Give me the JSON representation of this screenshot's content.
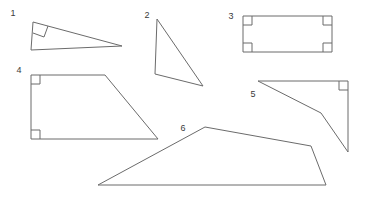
{
  "figure": {
    "background_color": "#ffffff",
    "stroke_color": "#6b6b6b",
    "label_color": "#3a3a3a",
    "width": 366,
    "height": 204,
    "shapes": [
      {
        "id": "shape-1",
        "label": "1",
        "kind": "right-triangle",
        "label_x": 13,
        "label_y": 14,
        "points": "33,22 122,46 31,50 33,22",
        "right_angle_marks": [
          "33,33 44,37 48,26"
        ]
      },
      {
        "id": "shape-2",
        "label": "2",
        "kind": "triangle",
        "label_x": 147,
        "label_y": 16,
        "points": "157,19 155,74 203,86 157,19",
        "right_angle_marks": []
      },
      {
        "id": "shape-3",
        "label": "3",
        "kind": "rectangle",
        "label_x": 231,
        "label_y": 17,
        "points": "243,16 332,16 332,52 243,52 243,16",
        "right_angle_marks": [
          "243,25 252,25 252,16",
          "332,25 323,25 323,16",
          "243,43 252,43 252,52",
          "332,43 323,43 323,52"
        ]
      },
      {
        "id": "shape-4",
        "label": "4",
        "kind": "right-trapezoid",
        "label_x": 19,
        "label_y": 71,
        "points": "31,75 105,75 158,139 31,139 31,75",
        "right_angle_marks": [
          "31,84 40,84 40,75",
          "31,130 40,130 40,139"
        ]
      },
      {
        "id": "shape-5",
        "label": "5",
        "kind": "concave-quadrilateral",
        "label_x": 253,
        "label_y": 95,
        "points": "258,81 348,81 348,152 321,113 258,81",
        "right_angle_marks": [
          "348,90 339,90 339,81"
        ]
      },
      {
        "id": "shape-6",
        "label": "6",
        "kind": "quadrilateral",
        "label_x": 183,
        "label_y": 129,
        "points": "205,127 311,146 326,185 98,185 205,127",
        "right_angle_marks": []
      }
    ]
  }
}
